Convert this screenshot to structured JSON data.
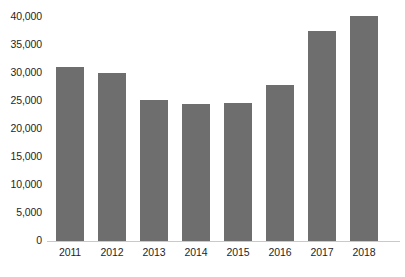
{
  "chart_data": {
    "type": "bar",
    "title": "",
    "subtitle": "",
    "xlabel": "",
    "ylabel": "",
    "categories": [
      "2011",
      "2012",
      "2013",
      "2014",
      "2015",
      "2016",
      "2017",
      "2018"
    ],
    "values": [
      31000,
      30000,
      25200,
      24500,
      24600,
      27900,
      37500,
      40200
    ],
    "series": [
      {
        "name": "",
        "values": [
          31000,
          30000,
          25200,
          24500,
          24600,
          27900,
          37500,
          40200
        ]
      }
    ],
    "ylim": [
      0,
      40000
    ],
    "y_ticks": [
      0,
      5000,
      10000,
      15000,
      20000,
      25000,
      30000,
      35000,
      40000
    ],
    "y_tick_labels": [
      "0",
      "5,000",
      "10,000",
      "15,000",
      "20,000",
      "25,000",
      "30,000",
      "35,000",
      "40,000"
    ],
    "x_tick_labels": [
      "2011",
      "2012",
      "2013",
      "2014",
      "2015",
      "2016",
      "2017",
      "2018"
    ],
    "grid": false,
    "legend": false,
    "legend_position": "none",
    "annotations": [],
    "bar_color": "#6e6e6e",
    "axis_color": "#c9c9c9",
    "background_color": "#ffffff",
    "text_color": "#1f1f1f"
  },
  "axis": {
    "y_labels": [
      "40,000",
      "35,000",
      "30,000",
      "25,000",
      "20,000",
      "15,000",
      "10,000",
      "5,000",
      "0"
    ],
    "x_labels": [
      "2011",
      "2012",
      "2013",
      "2014",
      "2015",
      "2016",
      "2017",
      "2018"
    ]
  }
}
